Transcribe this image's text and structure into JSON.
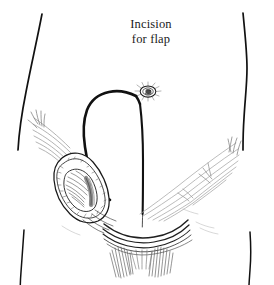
{
  "figure": {
    "name": "groin-flap-incision-illustration",
    "background_color": "#ffffff",
    "ink_color": "#111111",
    "light_ink_color": "#9a9a9a",
    "tissue_shade_color": "#9e9e9e",
    "width": 274,
    "height": 285
  },
  "caption": {
    "name": "incision-for-flap-label",
    "line1": "Incision",
    "line2": "for flap",
    "color": "#1a1a1a"
  },
  "corner": {
    "partial_glyph": "•"
  },
  "anatomy": {
    "parts": [
      {
        "id": "left-flank-outline",
        "label": "Left flank body outline"
      },
      {
        "id": "right-flank-outline",
        "label": "Right flank body outline"
      },
      {
        "id": "left-thigh-outline",
        "label": "Left thigh outline"
      },
      {
        "id": "right-thigh-outline",
        "label": "Right thigh outline"
      },
      {
        "id": "umbilicus",
        "label": "Umbilicus"
      },
      {
        "id": "flap-incision-outline",
        "label": "Flap incision outline"
      },
      {
        "id": "midline-incision",
        "label": "Midline incision"
      },
      {
        "id": "left-inguinal-dissection",
        "label": "Left inguinal lymph node dissection field"
      },
      {
        "id": "left-inguinal-hatching",
        "label": "Left inguinal ligament hatching"
      },
      {
        "id": "right-inguinal-hatching",
        "label": "Right inguinal ligament hatching"
      },
      {
        "id": "groin-crease-lines",
        "label": "Groin crease lines"
      },
      {
        "id": "pubic-hatching",
        "label": "Pubic region hatching"
      }
    ]
  }
}
